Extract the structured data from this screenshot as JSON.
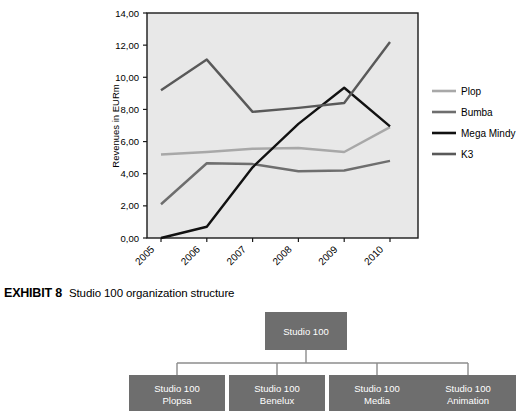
{
  "chart_data": {
    "type": "line",
    "title": "",
    "xlabel": "",
    "ylabel": "Revenues in EURm",
    "categories": [
      "2005",
      "2006",
      "2007",
      "2008",
      "2009",
      "2010"
    ],
    "ylim": [
      0,
      14
    ],
    "ytick_labels": [
      "0,00",
      "2,00",
      "4,00",
      "6,00",
      "8,00",
      "10,00",
      "12,00",
      "14,00"
    ],
    "ytick_values": [
      0,
      2,
      4,
      6,
      8,
      10,
      12,
      14
    ],
    "grid": false,
    "legend_position": "right",
    "plot_background": "#e8e8e8",
    "series": [
      {
        "name": "Plop",
        "color": "#a8a8a8",
        "values": [
          5.2,
          5.35,
          5.55,
          5.6,
          5.35,
          6.9
        ]
      },
      {
        "name": "Bumba",
        "color": "#6e6e6e",
        "values": [
          2.1,
          4.65,
          4.6,
          4.15,
          4.2,
          4.8
        ]
      },
      {
        "name": "Mega Mindy",
        "color": "#111111",
        "values": [
          0.0,
          0.7,
          4.4,
          7.1,
          9.35,
          6.95
        ]
      },
      {
        "name": "K3",
        "color": "#595959",
        "values": [
          9.2,
          11.1,
          7.85,
          8.1,
          8.4,
          12.2
        ]
      }
    ]
  },
  "exhibit": {
    "label": "EXHIBIT 8",
    "title": "Studio 100 organization structure"
  },
  "org_chart": {
    "box_color": "#6e6e6e",
    "line_color": "#8c8c8c",
    "root": {
      "line1": "Studio 100",
      "line2": ""
    },
    "children": [
      {
        "line1": "Studio 100",
        "line2": "Plopsa"
      },
      {
        "line1": "Studio 100",
        "line2": "Benelux"
      },
      {
        "line1": "Studio 100",
        "line2": "Media"
      },
      {
        "line1": "Studio 100",
        "line2": "Animation"
      }
    ]
  }
}
